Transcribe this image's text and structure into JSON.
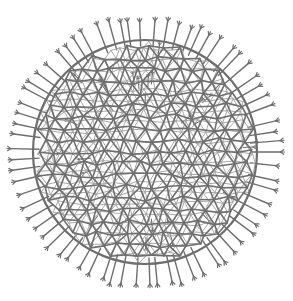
{
  "image": {
    "subject": "radiolarian skeleton illustration",
    "description": "Spherical lattice of irregular polygonal cells with radial spines ending in forked tips, drawn in gray ink on white",
    "colors": {
      "background": "#ffffff",
      "ink": "#6e6e6e",
      "ink_light": "#a8a8a8"
    }
  }
}
